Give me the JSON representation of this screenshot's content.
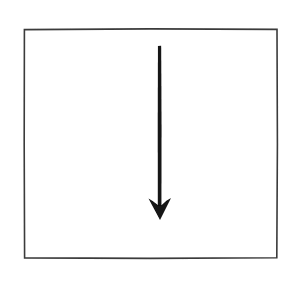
{
  "figure": {
    "canvas": {
      "width": 298,
      "height": 282,
      "background_color": "#ffffff"
    },
    "frame": {
      "name": "rectangular-border",
      "shape": "rectangle",
      "x": 24,
      "y": 29,
      "width": 253,
      "height": 229,
      "stroke_color": "#3a3a3a",
      "stroke_width": 1.6,
      "fill_color": "#ffffff",
      "style": "hand-drawn-scanned"
    },
    "arrow": {
      "name": "downward-arrow",
      "direction": "down",
      "color": "#121212",
      "shaft": {
        "x": 159.5,
        "y_start": 46,
        "y_end": 206,
        "width": 3.2,
        "cap": "butt"
      },
      "head": {
        "style": "barbed-concave",
        "tip_x": 160,
        "tip_y": 220,
        "left_barb_x": 148.5,
        "right_barb_x": 171,
        "barb_y": 198.5,
        "notch_y": 206,
        "width": 22.5,
        "height": 21.5
      }
    },
    "labels": [],
    "text_content": []
  }
}
